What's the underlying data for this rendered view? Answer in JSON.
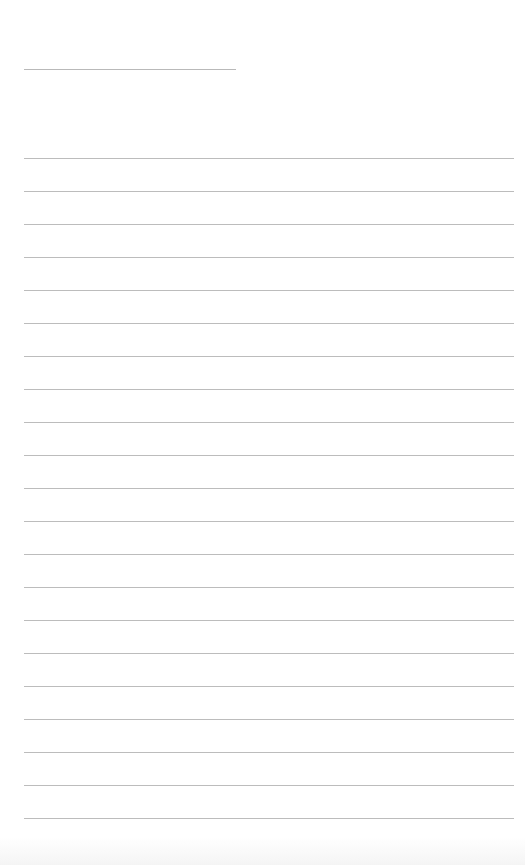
{
  "document": {
    "type": "blank lined sheet",
    "header_line": {
      "present": true,
      "label": ""
    },
    "ruled_lines": {
      "count": 21,
      "first_y": 158,
      "spacing": 33
    },
    "colors": {
      "background": "#ffffff",
      "line": "#bcbcbc"
    }
  }
}
